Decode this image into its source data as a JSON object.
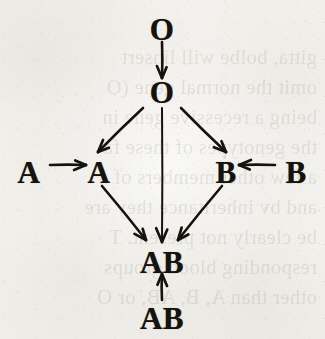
{
  "figure": {
    "kind": "inheritance-arrow-diagram",
    "ink_color": "#16120e",
    "paper_color": "#f7f6f3",
    "nodes": [
      {
        "id": "o-top",
        "label": "O",
        "x": 162,
        "y": 29,
        "role": "parent-genotype"
      },
      {
        "id": "o-middle",
        "label": "O",
        "x": 162,
        "y": 92,
        "role": "offspring-genotype"
      },
      {
        "id": "a-left",
        "label": "A",
        "x": 29,
        "y": 172,
        "role": "parent-genotype"
      },
      {
        "id": "a-middle",
        "label": "A",
        "x": 99,
        "y": 172,
        "role": "offspring-genotype"
      },
      {
        "id": "b-middle",
        "label": "B",
        "x": 226,
        "y": 172,
        "role": "offspring-genotype"
      },
      {
        "id": "b-right",
        "label": "B",
        "x": 296,
        "y": 172,
        "role": "parent-genotype"
      },
      {
        "id": "ab-middle",
        "label": "AB",
        "x": 162,
        "y": 262,
        "role": "offspring-genotype"
      },
      {
        "id": "ab-bottom",
        "label": "AB",
        "x": 162,
        "y": 318,
        "role": "parent-genotype"
      }
    ],
    "arrows": [
      {
        "id": "o-to-o",
        "from": "o-top",
        "to": "o-middle",
        "direction": "down",
        "x1": 162,
        "y1": 42,
        "x2": 162,
        "y2": 78
      },
      {
        "id": "o-to-a",
        "from": "o-middle",
        "to": "a-middle",
        "direction": "down-left",
        "x1": 143,
        "y1": 108,
        "x2": 98,
        "y2": 152
      },
      {
        "id": "o-to-ab",
        "from": "o-middle",
        "to": "ab-middle",
        "direction": "down",
        "x1": 162,
        "y1": 108,
        "x2": 162,
        "y2": 242
      },
      {
        "id": "o-to-b",
        "from": "o-middle",
        "to": "b-middle",
        "direction": "down-right",
        "x1": 181,
        "y1": 108,
        "x2": 226,
        "y2": 152
      },
      {
        "id": "a-to-a",
        "from": "a-left",
        "to": "a-middle",
        "direction": "right",
        "x1": 50,
        "y1": 165,
        "x2": 86,
        "y2": 165
      },
      {
        "id": "b-to-b",
        "from": "b-right",
        "to": "b-middle",
        "direction": "left",
        "x1": 275,
        "y1": 165,
        "x2": 239,
        "y2": 165
      },
      {
        "id": "a-to-ab",
        "from": "a-middle",
        "to": "ab-middle",
        "direction": "down-right",
        "x1": 102,
        "y1": 186,
        "x2": 146,
        "y2": 240
      },
      {
        "id": "b-to-ab",
        "from": "b-middle",
        "to": "ab-middle",
        "direction": "down-left",
        "x1": 222,
        "y1": 186,
        "x2": 178,
        "y2": 240
      },
      {
        "id": "ab-to-ab",
        "from": "ab-bottom",
        "to": "ab-middle",
        "direction": "up",
        "x1": 162,
        "y1": 300,
        "x2": 162,
        "y2": 274
      }
    ]
  },
  "bleedthrough": {
    "note": "faint mirrored text showing through from the reverse side of the page",
    "lines": [
      {
        "text": "gitta, bolbe will linsert",
        "y": 46
      },
      {
        "text": "omit the normal gene (O",
        "y": 76
      },
      {
        "text": "being a recessive gene in",
        "y": 106
      },
      {
        "text": "the genotypes of these fa",
        "y": 136
      },
      {
        "text": "a few other members of",
        "y": 166
      },
      {
        "text": "and bv inheritance they are",
        "y": 196
      },
      {
        "text": "be clearly not present. T",
        "y": 226
      },
      {
        "text": "responding blood groups",
        "y": 256
      },
      {
        "text": "other than A, B, AB, or O",
        "y": 286
      }
    ]
  }
}
